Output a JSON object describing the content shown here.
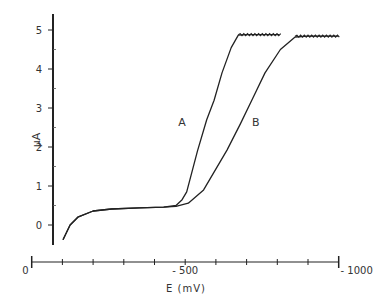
{
  "chart_data": {
    "type": "line",
    "title": "",
    "xlabel": "E (mV)",
    "ylabel": "μA",
    "xlim": [
      0,
      -1000
    ],
    "ylim": [
      -0.5,
      5.4
    ],
    "x_ticks": [
      0,
      -100,
      -200,
      -300,
      -400,
      -500,
      -600,
      -700,
      -800,
      -900,
      -1000
    ],
    "x_tick_labels": [
      {
        "value": 0,
        "label": "0"
      },
      {
        "value": -500,
        "label": "- 500"
      },
      {
        "value": -1000,
        "label": "- 1000"
      }
    ],
    "y_ticks": [
      0,
      1,
      2,
      3,
      4,
      5
    ],
    "y_tick_labels": [
      "0",
      "1",
      "2",
      "3",
      "4",
      "5"
    ],
    "grid": false,
    "legend": null,
    "annotations": [
      {
        "text": "A",
        "E": -490,
        "I": 2.55
      },
      {
        "text": "B",
        "E": -730,
        "I": 2.55
      }
    ],
    "series": [
      {
        "name": "A",
        "points": [
          [
            -102,
            -0.38
          ],
          [
            -125,
            0.0
          ],
          [
            -150,
            0.2
          ],
          [
            -200,
            0.36
          ],
          [
            -260,
            0.41
          ],
          [
            -350,
            0.44
          ],
          [
            -430,
            0.46
          ],
          [
            -470,
            0.5
          ],
          [
            -490,
            0.65
          ],
          [
            -505,
            0.85
          ],
          [
            -540,
            1.9
          ],
          [
            -570,
            2.7
          ],
          [
            -594,
            3.2
          ],
          [
            -620,
            3.9
          ],
          [
            -650,
            4.55
          ],
          [
            -673,
            4.87
          ],
          [
            -700,
            4.88
          ],
          [
            -806,
            4.88
          ]
        ]
      },
      {
        "name": "B",
        "points": [
          [
            -102,
            -0.38
          ],
          [
            -125,
            0.0
          ],
          [
            -150,
            0.2
          ],
          [
            -200,
            0.36
          ],
          [
            -260,
            0.41
          ],
          [
            -350,
            0.44
          ],
          [
            -430,
            0.46
          ],
          [
            -470,
            0.48
          ],
          [
            -510,
            0.56
          ],
          [
            -560,
            0.9
          ],
          [
            -636,
            1.92
          ],
          [
            -680,
            2.6
          ],
          [
            -717,
            3.2
          ],
          [
            -760,
            3.9
          ],
          [
            -810,
            4.5
          ],
          [
            -858,
            4.82
          ],
          [
            -900,
            4.84
          ],
          [
            -998,
            4.84
          ]
        ]
      }
    ]
  }
}
